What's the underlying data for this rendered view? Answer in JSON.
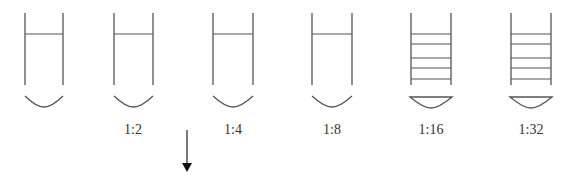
{
  "diagram": {
    "stroke_color": "#555555",
    "tubes": [
      {
        "id": 1,
        "label": "",
        "left": 25,
        "right": 63,
        "lines": [
          34
        ],
        "cap": "open-curve"
      },
      {
        "id": 2,
        "label": "1:2",
        "left": 114,
        "right": 153,
        "lines": [
          34
        ],
        "cap": "open-curve"
      },
      {
        "id": 3,
        "label": "1:4",
        "left": 213,
        "right": 253,
        "lines": [
          34
        ],
        "cap": "open-curve"
      },
      {
        "id": 4,
        "label": "1:8",
        "left": 312,
        "right": 352,
        "lines": [
          34
        ],
        "cap": "open-curve"
      },
      {
        "id": 5,
        "label": "1:16",
        "left": 411,
        "right": 451,
        "lines": [
          34,
          44,
          58,
          68,
          79
        ],
        "cap": "closed-curve"
      },
      {
        "id": 6,
        "label": "1:32",
        "left": 511,
        "right": 551,
        "lines": [
          34,
          44,
          58,
          68,
          79
        ],
        "cap": "closed-curve"
      }
    ],
    "arrow": {
      "x": 187,
      "y1": 130,
      "y2": 172,
      "direction": "down",
      "icon": "arrow-down-icon"
    }
  }
}
